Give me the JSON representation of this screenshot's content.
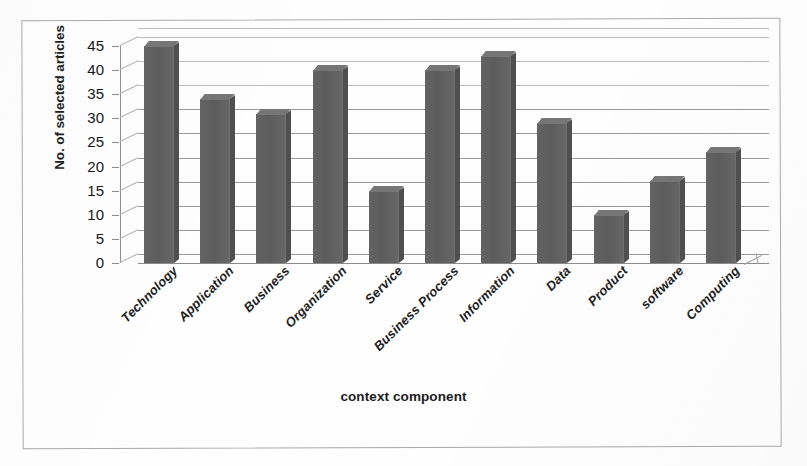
{
  "figure": {
    "background_color": "#fefefe",
    "frame_color": "#a9a9a9",
    "bar_color": "#5f5f5f",
    "grid_color": "#9a9a9a",
    "bottom_caption": ""
  },
  "chart_data": {
    "type": "bar",
    "title": "",
    "xlabel": "context component",
    "ylabel": "No. of selected articles",
    "categories": [
      "Technology",
      "Application",
      "Business",
      "Organization",
      "Service",
      "Business Process",
      "Information",
      "Data",
      "Product",
      "software",
      "Computing"
    ],
    "values": [
      45,
      34,
      31,
      40,
      15,
      40,
      43,
      29,
      10,
      17,
      23
    ],
    "ylim": [
      0,
      45
    ],
    "yticks": [
      0,
      5,
      10,
      15,
      20,
      25,
      30,
      35,
      40,
      45
    ],
    "ytick_labels": [
      "0",
      "5",
      "10",
      "15",
      "20",
      "25",
      "30",
      "35",
      "40",
      "45"
    ],
    "grid": true,
    "grid_axis": "y",
    "legend": false,
    "style": "3d-column",
    "series": [
      {
        "name": "No. of selected articles",
        "values": [
          45,
          34,
          31,
          40,
          15,
          40,
          43,
          29,
          10,
          17,
          23
        ]
      }
    ]
  }
}
